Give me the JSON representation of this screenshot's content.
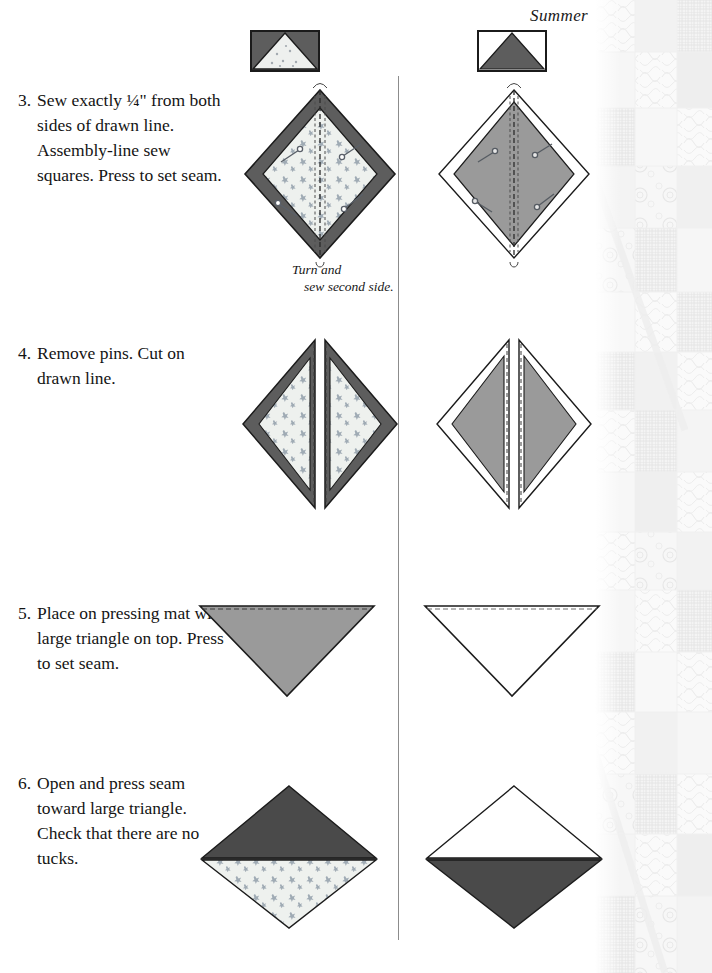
{
  "page": {
    "header_title": "Summer",
    "width": 712,
    "height": 973
  },
  "colors": {
    "dark_gray": "#595959",
    "darker_gray": "#4a4a4a",
    "mid_gray": "#9a9a9a",
    "light_print": "#eef0ee",
    "white": "#ffffff",
    "outline": "#1b1b1b",
    "divider": "#8c8c8c",
    "watermark": "#e9e9e9"
  },
  "steps": [
    {
      "number": "3.",
      "text": "Sew exactly ¼\" from both sides of drawn line. Assembly-line sew squares.  Press to set seam."
    },
    {
      "number": "4.",
      "text": "Remove pins. Cut on drawn line."
    },
    {
      "number": "5.",
      "text": "Place on pressing mat with large triangle on top. Press to set seam."
    },
    {
      "number": "6.",
      "text": "Open and press seam toward large triangle. Check that there are no tucks."
    }
  ],
  "caption": {
    "line1": "Turn and",
    "line2": "sew second side."
  },
  "thumbnails": [
    {
      "name": "left-block-thumbnail",
      "background": "dark-gray",
      "triangle": "light-printed-fabric",
      "orientation": "point-up"
    },
    {
      "name": "right-block-thumbnail",
      "background": "white",
      "triangle": "dark-gray",
      "orientation": "point-up"
    }
  ],
  "figures": [
    {
      "step": "3",
      "column": "left",
      "description": "Pinned square on point, dark gray border band over light printed fabric, dashed drawn center line with two stitching lines, four pins"
    },
    {
      "step": "3",
      "column": "right",
      "description": "Pinned square on point, white outer square over medium gray square, dashed drawn center line with two stitching lines, four pins"
    },
    {
      "step": "4",
      "column": "left",
      "description": "Square on point cut along drawn line into two halves, dark gray band over light printed fabric"
    },
    {
      "step": "4",
      "column": "right",
      "description": "Square on point cut along drawn line into two halves, white over medium gray"
    },
    {
      "step": "5",
      "column": "left",
      "description": "Medium gray triangle pointing down with dashed seam line along top edge"
    },
    {
      "step": "5",
      "column": "right",
      "description": "White triangle pointing down with dashed seam line along top edge"
    },
    {
      "step": "6",
      "column": "left",
      "description": "Opened unit on point: dark gray triangle on top, light printed fabric triangle below"
    },
    {
      "step": "6",
      "column": "right",
      "description": "Opened unit on point: white triangle on top, dark gray triangle below"
    }
  ]
}
